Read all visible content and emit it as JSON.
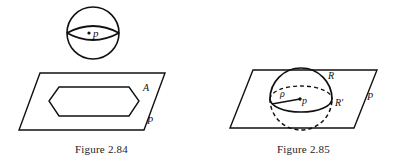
{
  "page": {
    "background_color": "#ffffff",
    "ink_color": "#111111",
    "width": 405,
    "height": 167
  },
  "figures": [
    {
      "id": "figure-2-84",
      "caption": "Figure 2.84",
      "description": "A sphere with a point p above a plane P containing a hexagonal region A",
      "shapes": {
        "sphere": {
          "name": "sphere-outline",
          "center_label": "p",
          "point_marker": "dot",
          "equator": "lens"
        },
        "plane": {
          "name": "plane-parallelogram",
          "label": "P"
        },
        "region": {
          "name": "hexagon-region",
          "label": "A"
        }
      },
      "labels": {
        "point_p": "p",
        "region_a": "A",
        "plane_p": "P"
      }
    },
    {
      "id": "figure-2-85",
      "caption": "Figure 2.85",
      "description": "A sphere of radius rho centered at point p intersecting plane P, showing regions R and R prime",
      "shapes": {
        "sphere": {
          "name": "sphere-outline",
          "center_label": "p",
          "radius_label": "ρ",
          "upper_hemisphere": "solid",
          "lower_hemisphere": "dashed"
        },
        "plane": {
          "name": "plane-parallelogram",
          "label": "P"
        }
      },
      "labels": {
        "radius_rho": "ρ",
        "point_p": "p",
        "region_r": "R",
        "region_r_prime": "R′",
        "plane_p": "P"
      }
    }
  ]
}
